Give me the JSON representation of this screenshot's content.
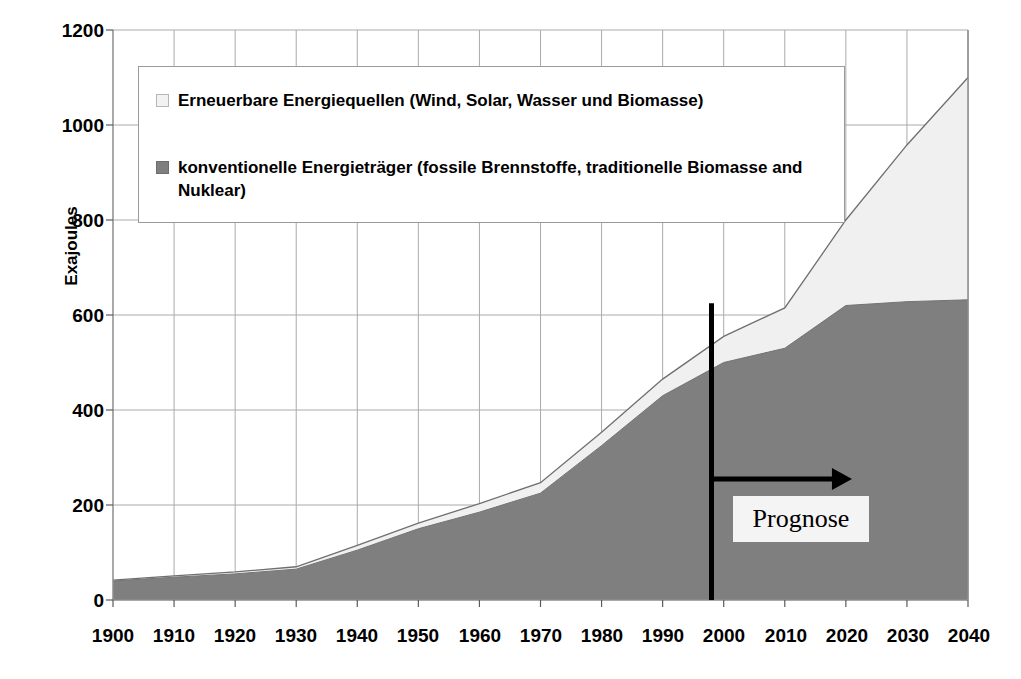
{
  "chart_data": {
    "type": "area",
    "stacked": true,
    "title": "",
    "xlabel": "",
    "ylabel": "Exajoules",
    "xlim": [
      1900,
      2040
    ],
    "ylim": [
      0,
      1200
    ],
    "ytick_labels": [
      "1200",
      "1000",
      "800",
      "600",
      "400",
      "200",
      "0"
    ],
    "ytick_values": [
      1200,
      1000,
      800,
      600,
      400,
      200,
      0
    ],
    "xtick_labels": [
      "1900",
      "1910",
      "1920",
      "1930",
      "1940",
      "1950",
      "1960",
      "1970",
      "1980",
      "1990",
      "2000",
      "2010",
      "2020",
      "2030",
      "2040"
    ],
    "xtick_values": [
      1900,
      1910,
      1920,
      1930,
      1940,
      1950,
      1960,
      1970,
      1980,
      1990,
      2000,
      2010,
      2020,
      2030,
      2040
    ],
    "grid": true,
    "legend_position": "upper-left-inside",
    "x": [
      1900,
      1910,
      1920,
      1930,
      1940,
      1950,
      1960,
      1970,
      1980,
      1990,
      2000,
      2010,
      2020,
      2030,
      2040
    ],
    "series": [
      {
        "name": "konventionelle Energieträger (fossile Brennstoffe, traditionelle Biomasse and Nuklear)",
        "color": "#7f7f7f",
        "values": [
          40,
          48,
          55,
          65,
          105,
          150,
          185,
          225,
          325,
          430,
          500,
          530,
          620,
          628,
          632
        ]
      },
      {
        "name": "Erneuerbare Energiequellen (Wind, Solar, Wasser und Biomasse)",
        "color": "#f0f0f0",
        "values": [
          2,
          3,
          4,
          5,
          10,
          12,
          18,
          22,
          28,
          35,
          55,
          85,
          180,
          330,
          468
        ]
      }
    ],
    "totals": [
      42,
      51,
      59,
      70,
      115,
      162,
      203,
      247,
      353,
      465,
      555,
      615,
      800,
      958,
      1100
    ],
    "annotations": [
      {
        "name": "prognose-divider",
        "type": "vline",
        "x": 1998,
        "label": "",
        "color": "#000000"
      },
      {
        "name": "prognose-arrow",
        "type": "arrow",
        "from_x": 1998,
        "to_x": 2021,
        "y": 255,
        "color": "#000000"
      },
      {
        "name": "prognose-label",
        "type": "text",
        "text": "Prognose",
        "x": 2011,
        "y": 180
      }
    ]
  },
  "axes": {
    "y_title": "Exajoules"
  },
  "legend": {
    "items": [
      {
        "label": "Erneuerbare Energiequellen (Wind, Solar, Wasser und Biomasse)",
        "swatch": "open-square"
      },
      {
        "label": "konventionelle Energieträger (fossile Brennstoffe, traditionelle Biomasse and Nuklear)",
        "swatch": "solid-square"
      }
    ]
  },
  "annotation": {
    "prognose_label": "Prognose"
  },
  "colors": {
    "conventional": "#7f7f7f",
    "renewable": "#f0f0f0",
    "grid": "#aaaaaa",
    "axis": "#888888",
    "annotation": "#000000"
  }
}
